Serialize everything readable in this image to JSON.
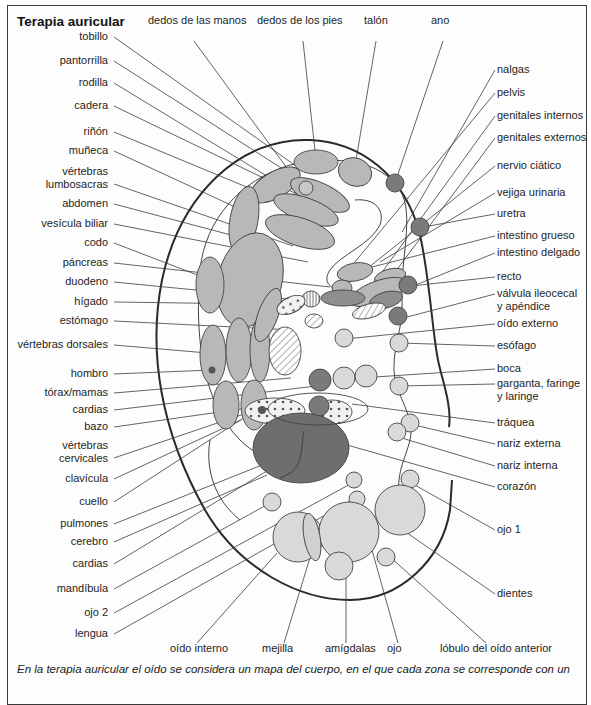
{
  "title": "Terapia auricular",
  "caption": "En la terapia auricular el oído se considera un mapa del cuerpo, en el que cada zona se corresponde con un",
  "colors": {
    "border": "#3a3a3a",
    "light_fill": "#d9d9d9",
    "mid_fill": "#b8b8b8",
    "dark_fill": "#7a7a7a",
    "darkest_fill": "#6e6e6e",
    "line": "#3c3c3c"
  },
  "labels_top": [
    {
      "text": "dedos de las manos",
      "x": 148,
      "y": 21,
      "tx": 194,
      "ty": 41,
      "ex": 303,
      "ey": 190
    },
    {
      "text": "dedos de los pies",
      "x": 257,
      "y": 21,
      "tx": 303,
      "ty": 41,
      "ex": 316,
      "ey": 160
    },
    {
      "text": "talón",
      "x": 364,
      "y": 21,
      "tx": 376,
      "ty": 41,
      "ex": 354,
      "ey": 172
    },
    {
      "text": "ano",
      "x": 431,
      "y": 21,
      "tx": 443,
      "ty": 41,
      "ex": 395,
      "ey": 183
    }
  ],
  "labels_left": [
    {
      "text": "tobillo",
      "y": 37,
      "ex": 296,
      "ey": 166
    },
    {
      "text": "pantorrilla",
      "y": 61,
      "ex": 300,
      "ey": 180
    },
    {
      "text": "rodilla",
      "y": 83,
      "ex": 290,
      "ey": 190
    },
    {
      "text": "cadera",
      "y": 106,
      "ex": 305,
      "ey": 198
    },
    {
      "text": "riñón",
      "y": 132,
      "ex": 302,
      "ey": 210
    },
    {
      "text": "muñeca",
      "y": 151,
      "ex": 246,
      "ey": 212
    },
    {
      "text": "vértebras",
      "text2": "lumbosacras",
      "y": 172,
      "ex": 293,
      "ey": 246
    },
    {
      "text": "abdomen",
      "y": 204,
      "ex": 250,
      "ey": 240
    },
    {
      "text": "vesícula biliar",
      "y": 224,
      "ex": 308,
      "ey": 262
    },
    {
      "text": "codo",
      "y": 243,
      "ex": 213,
      "ey": 281
    },
    {
      "text": "páncreas",
      "y": 263,
      "ex": 330,
      "ey": 287
    },
    {
      "text": "duodeno",
      "y": 282,
      "ex": 308,
      "ey": 301
    },
    {
      "text": "hígado",
      "y": 302,
      "ex": 257,
      "ey": 304
    },
    {
      "text": "estómago",
      "y": 321,
      "ex": 293,
      "ey": 330
    },
    {
      "text": "vértebras dorsales",
      "y": 345,
      "ex": 231,
      "ey": 355
    },
    {
      "text": "hombro",
      "y": 374,
      "ex": 212,
      "ey": 370
    },
    {
      "text": "tórax/mamas",
      "y": 393,
      "ex": 291,
      "ey": 378
    },
    {
      "text": "cardias",
      "y": 410,
      "ex": 325,
      "ey": 385
    },
    {
      "text": "bazo",
      "y": 427,
      "ex": 290,
      "ey": 402
    },
    {
      "text": "vértebras",
      "text2": "cervicales",
      "y": 446,
      "ex": 250,
      "ey": 412
    },
    {
      "text": "clavícula",
      "y": 479,
      "ex": 241,
      "ey": 420
    },
    {
      "text": "cuello",
      "y": 502,
      "ex": 262,
      "ey": 406
    },
    {
      "text": "pulmones",
      "y": 524,
      "ex": 262,
      "ey": 465
    },
    {
      "text": "cerebro",
      "y": 542,
      "ex": 267,
      "ey": 475
    },
    {
      "text": "cardias",
      "y": 564,
      "ex": 285,
      "ey": 460
    },
    {
      "text": "mandíbula",
      "y": 589,
      "ex": 272,
      "ey": 502
    },
    {
      "text": "ojo 2",
      "y": 613,
      "ex": 354,
      "ey": 482
    },
    {
      "text": "lengua",
      "y": 634,
      "ex": 352,
      "ey": 500
    }
  ],
  "labels_right": [
    {
      "text": "nalgas",
      "y": 70,
      "ex": 402,
      "ey": 232
    },
    {
      "text": "pelvis",
      "y": 93,
      "ex": 354,
      "ey": 263
    },
    {
      "text": "genitales internos",
      "y": 116,
      "ex": 375,
      "ey": 282
    },
    {
      "text": "genitales externos",
      "y": 138,
      "ex": 378,
      "ey": 295
    },
    {
      "text": "nervio ciático",
      "y": 166,
      "ex": 338,
      "ey": 292
    },
    {
      "text": "vejiga urinaria",
      "y": 193,
      "ex": 380,
      "ey": 262
    },
    {
      "text": "uretra",
      "y": 214,
      "ex": 418,
      "ey": 228
    },
    {
      "text": "intestino grueso",
      "y": 236,
      "ex": 360,
      "ey": 270
    },
    {
      "text": "intestino delgado",
      "y": 253,
      "ex": 366,
      "ey": 305
    },
    {
      "text": "recto",
      "y": 277,
      "ex": 411,
      "ey": 286
    },
    {
      "text": "válvula ileocecal",
      "text2": "y apéndice",
      "y": 294,
      "ex": 407,
      "ey": 317
    },
    {
      "text": "oído externo",
      "y": 324,
      "ex": 345,
      "ey": 339
    },
    {
      "text": "esófago",
      "y": 346,
      "ex": 400,
      "ey": 343
    },
    {
      "text": "boca",
      "y": 369,
      "ex": 345,
      "ey": 379
    },
    {
      "text": "garganta, faringe",
      "text2": "y laringe",
      "y": 384,
      "ex": 400,
      "ey": 386
    },
    {
      "text": "tráquea",
      "y": 423,
      "ex": 352,
      "ey": 404
    },
    {
      "text": "nariz externa",
      "y": 444,
      "ex": 410,
      "ey": 424
    },
    {
      "text": "nariz interna",
      "y": 466,
      "ex": 395,
      "ey": 436
    },
    {
      "text": "corazón",
      "y": 487,
      "ex": 340,
      "ey": 443
    },
    {
      "text": "ojo 1",
      "y": 530,
      "ex": 413,
      "ey": 484
    },
    {
      "text": "dientes",
      "y": 594,
      "ex": 400,
      "ey": 528
    }
  ],
  "labels_bottom": [
    {
      "text": "oído interno",
      "x": 170,
      "y": 649,
      "tx": 197,
      "ty": 643,
      "ex": 277,
      "ey": 553
    },
    {
      "text": "mejilla",
      "x": 262,
      "y": 649,
      "tx": 284,
      "ty": 643,
      "ex": 312,
      "ey": 551
    },
    {
      "text": "amígdalas",
      "x": 325,
      "y": 649,
      "tx": 346,
      "ty": 643,
      "ex": 346,
      "ey": 573
    },
    {
      "text": "ojo",
      "x": 387,
      "y": 649,
      "tx": 398,
      "ty": 643,
      "ex": 372,
      "ey": 550
    },
    {
      "text": "lóbulo del oído anterior",
      "x": 440,
      "y": 649,
      "tx": 486,
      "ty": 643,
      "ex": 390,
      "ey": 557
    }
  ]
}
